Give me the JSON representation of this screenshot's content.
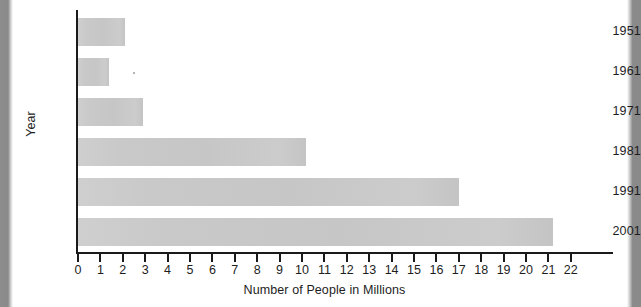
{
  "chart_data": {
    "type": "bar",
    "orientation": "horizontal",
    "title": "",
    "categories": [
      "1951",
      "1961",
      "1971",
      "1981",
      "1991",
      "2001"
    ],
    "values": [
      2.1,
      1.4,
      2.9,
      10.2,
      17.0,
      21.2
    ],
    "xlabel": "Number of People in Millions",
    "ylabel": "Year",
    "xlim": [
      0,
      22
    ],
    "xticks": [
      0,
      1,
      2,
      3,
      4,
      5,
      6,
      7,
      8,
      9,
      10,
      11,
      12,
      13,
      14,
      15,
      16,
      17,
      18,
      19,
      20,
      21,
      22
    ],
    "xticklabels": [
      "0",
      "1",
      "2",
      "3",
      "4",
      "5",
      "6",
      "7",
      "8",
      "9",
      "10",
      "11",
      "12",
      "13",
      "14",
      "15",
      "16",
      "17",
      "18",
      "19",
      "20",
      "21",
      "22"
    ],
    "grid": false,
    "legend": null,
    "series": [
      {
        "name": "Number of People in Millions",
        "values": [
          2.1,
          1.4,
          2.9,
          10.2,
          17.0,
          21.2
        ]
      }
    ],
    "bar_color": "#c8c8c8",
    "axis_color": "#1a1a1a",
    "background_color": "#ffffff"
  }
}
